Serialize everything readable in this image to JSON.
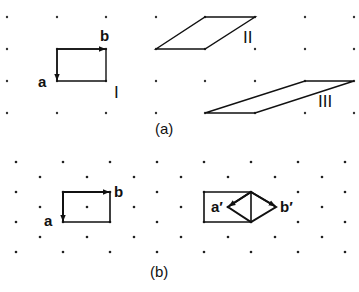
{
  "figure": {
    "panel_a": {
      "caption": "(a)",
      "grid": {
        "type": "square",
        "xs": [
          7,
          57,
          106,
          156,
          205,
          255,
          305,
          354
        ],
        "ys": [
          17,
          49,
          81,
          113
        ]
      },
      "cells": [
        {
          "name": "I",
          "label": "I",
          "points": "57,49 106,49 106,81 57,81",
          "label_pos": [
            114,
            98
          ]
        },
        {
          "name": "II",
          "label": "II",
          "points": "205,17 255,17 205,49 156,49",
          "label_pos": [
            243,
            43
          ]
        },
        {
          "name": "III",
          "label": "III",
          "points": "305,81 354,81 255,113 205,113",
          "label_pos": [
            318,
            107
          ]
        }
      ],
      "vectors": [
        {
          "name": "a",
          "label": "a",
          "from": [
            57,
            49
          ],
          "to": [
            57,
            80
          ],
          "label_pos": [
            38,
            87
          ]
        },
        {
          "name": "b",
          "label": "b",
          "from": [
            57,
            49
          ],
          "to": [
            105,
            49
          ],
          "label_pos": [
            100,
            41
          ]
        }
      ],
      "caption_pos": [
        155,
        134
      ]
    },
    "panel_b": {
      "caption": "(b)",
      "grid": {
        "type": "hexagonal",
        "rows": [
          {
            "y": 162,
            "xs": [
              16,
              63,
              110,
              157,
              204,
              251,
              298,
              345
            ]
          },
          {
            "y": 177,
            "xs": [
              40,
              87,
              134,
              181,
              228,
              275,
              322
            ]
          },
          {
            "y": 192,
            "xs": [
              16,
              63,
              110,
              157,
              204,
              251,
              298,
              345
            ]
          },
          {
            "y": 207,
            "xs": [
              40,
              87,
              134,
              181,
              228,
              275,
              322
            ]
          },
          {
            "y": 222,
            "xs": [
              16,
              63,
              110,
              157,
              204,
              251,
              298,
              345
            ]
          },
          {
            "y": 237,
            "xs": [
              40,
              87,
              134,
              181,
              228,
              275,
              322
            ]
          },
          {
            "y": 252,
            "xs": [
              16,
              63,
              110,
              157,
              204,
              251,
              298,
              345
            ]
          }
        ]
      },
      "rect_left": {
        "points": "63,192 110,192 110,222 63,222"
      },
      "rect_right": {
        "points": "204,192 251,192 251,222 204,222"
      },
      "diamond": {
        "points": "251,192 276,207 251,222 228,207"
      },
      "vectors": [
        {
          "name": "a",
          "label": "a",
          "from": [
            63,
            192
          ],
          "to": [
            63,
            221
          ],
          "label_pos": [
            44,
            226
          ]
        },
        {
          "name": "b",
          "label": "b",
          "from": [
            63,
            192
          ],
          "to": [
            109,
            192
          ],
          "label_pos": [
            114,
            197
          ]
        },
        {
          "name": "a-prime",
          "label": "a′",
          "from": [
            251,
            192
          ],
          "to": [
            229,
            206
          ],
          "label_pos": [
            211,
            212
          ]
        },
        {
          "name": "b-prime",
          "label": "b′",
          "from": [
            251,
            192
          ],
          "to": [
            275,
            206
          ],
          "label_pos": [
            280,
            212
          ]
        }
      ],
      "caption_pos": [
        150,
        277
      ]
    }
  }
}
